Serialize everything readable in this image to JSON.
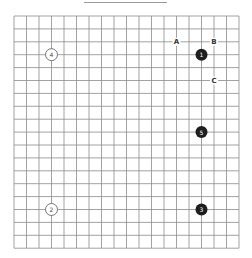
{
  "board": {
    "size": 19,
    "origin_x": 14,
    "origin_y": 16,
    "step_x": 12.5,
    "step_y": 12.9,
    "line_color": "#8a8a8a",
    "background": "#ffffff"
  },
  "stones": [
    {
      "color": "black",
      "col": 15,
      "row": 3,
      "label": "1"
    },
    {
      "color": "white",
      "col": 3,
      "row": 15,
      "label": "2"
    },
    {
      "color": "black",
      "col": 15,
      "row": 15,
      "label": "3"
    },
    {
      "color": "white",
      "col": 3,
      "row": 3,
      "label": "4"
    },
    {
      "color": "black",
      "col": 15,
      "row": 9,
      "label": "5"
    }
  ],
  "markers": [
    {
      "label": "A",
      "col": 13,
      "row": 2
    },
    {
      "label": "B",
      "col": 16,
      "row": 2
    },
    {
      "label": "C",
      "col": 16,
      "row": 5
    }
  ],
  "colors": {
    "black_stone": "#1e1e1e",
    "white_stone": "#ffffff",
    "white_stone_border": "#555555",
    "black_label": "#ffffff",
    "white_label": "#444444"
  }
}
